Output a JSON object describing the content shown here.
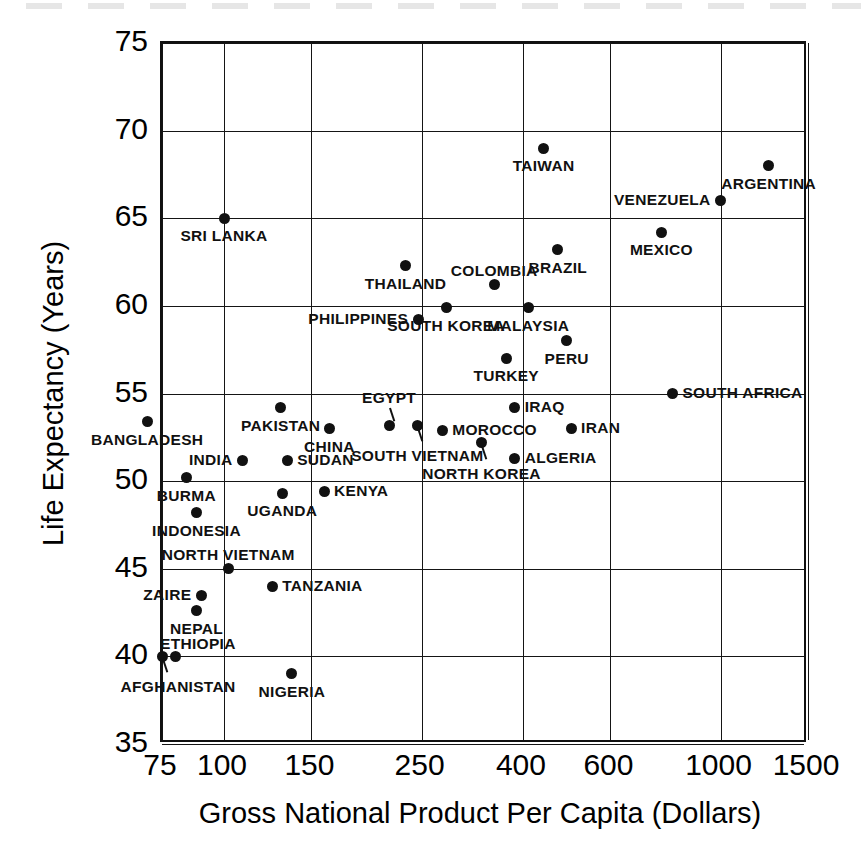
{
  "figure": {
    "kind": "scatter-plot",
    "background": "#ffffff",
    "ink_color": "#111111"
  },
  "chart_data": {
    "type": "scatter",
    "title": "",
    "subtitle": "",
    "xlabel": "Gross National Product Per Capita (Dollars)",
    "ylabel": "Life Expectancy (Years)",
    "xscale": "log",
    "yscale": "linear",
    "xlim": [
      75,
      1500
    ],
    "ylim": [
      35,
      75
    ],
    "xticks": [
      75,
      100,
      150,
      250,
      400,
      600,
      1000,
      1500
    ],
    "xtick_labels": [
      "75",
      "100",
      "150",
      "250",
      "400",
      "600",
      "1000",
      "1500"
    ],
    "yticks": [
      35,
      40,
      45,
      50,
      55,
      60,
      65,
      70,
      75
    ],
    "ytick_labels": [
      "35",
      "40",
      "45",
      "50",
      "55",
      "60",
      "65",
      "70",
      "75"
    ],
    "grid": true,
    "legend": "none",
    "marker": "filled-circle",
    "points": [
      {
        "name": "AFGHANISTAN",
        "x": 75,
        "y": 40.0,
        "label_pos": "below-left",
        "leader": true
      },
      {
        "name": "ETHIOPIA",
        "x": 80,
        "y": 40.0,
        "label_pos": "above-right"
      },
      {
        "name": "NEPAL",
        "x": 88,
        "y": 42.6,
        "label_pos": "below-center"
      },
      {
        "name": "ZAIRE",
        "x": 90,
        "y": 43.5,
        "label_pos": "left"
      },
      {
        "name": "NORTH VIETNAM",
        "x": 102,
        "y": 45.0,
        "label_pos": "above-center"
      },
      {
        "name": "TANZANIA",
        "x": 125,
        "y": 44.0,
        "label_pos": "right"
      },
      {
        "name": "NIGERIA",
        "x": 137,
        "y": 39.0,
        "label_pos": "below-center"
      },
      {
        "name": "INDONESIA",
        "x": 88,
        "y": 48.2,
        "label_pos": "below-center"
      },
      {
        "name": "BURMA",
        "x": 84,
        "y": 50.2,
        "label_pos": "below-center"
      },
      {
        "name": "UGANDA",
        "x": 131,
        "y": 49.3,
        "label_pos": "below-center"
      },
      {
        "name": "KENYA",
        "x": 159,
        "y": 49.4,
        "label_pos": "right"
      },
      {
        "name": "BANGLADESH",
        "x": 70,
        "y": 53.4,
        "label_pos": "below-center"
      },
      {
        "name": "INDIA",
        "x": 109,
        "y": 51.2,
        "label_pos": "left"
      },
      {
        "name": "SUDAN",
        "x": 134,
        "y": 51.2,
        "label_pos": "right"
      },
      {
        "name": "PAKISTAN",
        "x": 130,
        "y": 54.2,
        "label_pos": "below-center"
      },
      {
        "name": "CHINA",
        "x": 163,
        "y": 53.0,
        "label_pos": "below-center"
      },
      {
        "name": "EGYPT",
        "x": 215,
        "y": 53.2,
        "label_pos": "above-center",
        "leader": true
      },
      {
        "name": "SOUTH VIETNAM",
        "x": 245,
        "y": 53.2,
        "label_pos": "below-center",
        "leader": true
      },
      {
        "name": "MOROCCO",
        "x": 275,
        "y": 52.9,
        "label_pos": "right"
      },
      {
        "name": "NORTH KOREA",
        "x": 330,
        "y": 52.2,
        "label_pos": "below-center",
        "leader": true
      },
      {
        "name": "ALGERIA",
        "x": 385,
        "y": 51.3,
        "label_pos": "right"
      },
      {
        "name": "IRAQ",
        "x": 385,
        "y": 54.2,
        "label_pos": "right"
      },
      {
        "name": "IRAN",
        "x": 500,
        "y": 53.0,
        "label_pos": "right"
      },
      {
        "name": "SOUTH AFRICA",
        "x": 800,
        "y": 55.0,
        "label_pos": "right"
      },
      {
        "name": "SRI LANKA",
        "x": 100,
        "y": 65.0,
        "label_pos": "below-center"
      },
      {
        "name": "THAILAND",
        "x": 232,
        "y": 62.3,
        "label_pos": "below-center"
      },
      {
        "name": "PHILIPPINES",
        "x": 246,
        "y": 59.2,
        "label_pos": "left"
      },
      {
        "name": "SOUTH KOREA",
        "x": 280,
        "y": 59.9,
        "label_pos": "below-center"
      },
      {
        "name": "COLOMBIA",
        "x": 350,
        "y": 61.2,
        "label_pos": "above-center"
      },
      {
        "name": "MALAYSIA",
        "x": 410,
        "y": 59.9,
        "label_pos": "below-center"
      },
      {
        "name": "TURKEY",
        "x": 370,
        "y": 57.0,
        "label_pos": "below-center"
      },
      {
        "name": "PERU",
        "x": 490,
        "y": 58.0,
        "label_pos": "below-center"
      },
      {
        "name": "BRAZIL",
        "x": 470,
        "y": 63.2,
        "label_pos": "below-center"
      },
      {
        "name": "TAIWAN",
        "x": 440,
        "y": 69.0,
        "label_pos": "below-center"
      },
      {
        "name": "MEXICO",
        "x": 760,
        "y": 64.2,
        "label_pos": "below-center"
      },
      {
        "name": "VENEZUELA",
        "x": 1000,
        "y": 66.0,
        "label_pos": "left"
      },
      {
        "name": "ARGENTINA",
        "x": 1250,
        "y": 68.0,
        "label_pos": "below-center"
      }
    ]
  }
}
